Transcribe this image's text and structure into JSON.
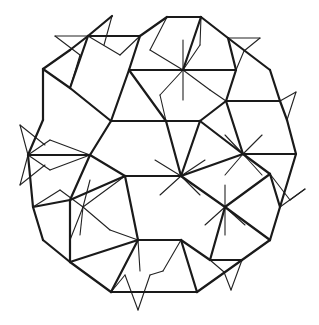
{
  "figure": {
    "background": "#ffffff",
    "stroke_color": "#1a1a1a",
    "thick_edges": [
      [
        112,
        16,
        88,
        36
      ],
      [
        88,
        36,
        140,
        36
      ],
      [
        140,
        36,
        167,
        17
      ],
      [
        167,
        17,
        201,
        17
      ],
      [
        201,
        17,
        228,
        38
      ],
      [
        228,
        38,
        270,
        70
      ],
      [
        270,
        70,
        280,
        101
      ],
      [
        280,
        101,
        287,
        120
      ],
      [
        287,
        120,
        296,
        154
      ],
      [
        296,
        154,
        280,
        207
      ],
      [
        280,
        207,
        270,
        240
      ],
      [
        270,
        240,
        242,
        260
      ],
      [
        242,
        260,
        197,
        292
      ],
      [
        197,
        292,
        111,
        292
      ],
      [
        111,
        292,
        70,
        262
      ],
      [
        70,
        262,
        43,
        240
      ],
      [
        43,
        240,
        33,
        207
      ],
      [
        33,
        207,
        28,
        155
      ],
      [
        28,
        155,
        43,
        120
      ],
      [
        43,
        120,
        43,
        69
      ],
      [
        43,
        69,
        70,
        50
      ],
      [
        70,
        50,
        88,
        36
      ],
      [
        43,
        69,
        70,
        88
      ],
      [
        70,
        88,
        88,
        36
      ],
      [
        70,
        88,
        111,
        121
      ],
      [
        111,
        121,
        129,
        70
      ],
      [
        129,
        70,
        140,
        36
      ],
      [
        129,
        70,
        183,
        70
      ],
      [
        183,
        70,
        201,
        17
      ],
      [
        183,
        70,
        236,
        70
      ],
      [
        236,
        70,
        228,
        38
      ],
      [
        236,
        70,
        226,
        101
      ],
      [
        226,
        101,
        280,
        101
      ],
      [
        226,
        101,
        200,
        121
      ],
      [
        200,
        121,
        166,
        121
      ],
      [
        166,
        121,
        129,
        70
      ],
      [
        166,
        121,
        111,
        121
      ],
      [
        111,
        121,
        90,
        155
      ],
      [
        90,
        155,
        28,
        155
      ],
      [
        90,
        155,
        125,
        176
      ],
      [
        125,
        176,
        70,
        200
      ],
      [
        70,
        200,
        33,
        207
      ],
      [
        125,
        176,
        181,
        176
      ],
      [
        181,
        176,
        200,
        121
      ],
      [
        181,
        176,
        243,
        154
      ],
      [
        243,
        154,
        226,
        101
      ],
      [
        243,
        154,
        296,
        154
      ],
      [
        243,
        154,
        270,
        174
      ],
      [
        270,
        174,
        280,
        207
      ],
      [
        270,
        174,
        225,
        207
      ],
      [
        225,
        207,
        181,
        176
      ],
      [
        225,
        207,
        270,
        240
      ],
      [
        225,
        207,
        210,
        260
      ],
      [
        210,
        260,
        242,
        260
      ],
      [
        210,
        260,
        181,
        240
      ],
      [
        181,
        240,
        138,
        240
      ],
      [
        181,
        240,
        197,
        292
      ],
      [
        138,
        240,
        125,
        176
      ],
      [
        138,
        240,
        111,
        292
      ],
      [
        138,
        240,
        70,
        262
      ],
      [
        70,
        262,
        70,
        200
      ],
      [
        90,
        155,
        70,
        200
      ],
      [
        166,
        121,
        181,
        176
      ],
      [
        200,
        121,
        243,
        154
      ]
    ],
    "thin_edges": [
      [
        88,
        36,
        120,
        55
      ],
      [
        120,
        55,
        140,
        36
      ],
      [
        112,
        16,
        104,
        45
      ],
      [
        55,
        36,
        88,
        36
      ],
      [
        55,
        36,
        80,
        55
      ],
      [
        80,
        55,
        70,
        88
      ],
      [
        183,
        70,
        150,
        50
      ],
      [
        183,
        70,
        200,
        45
      ],
      [
        183,
        70,
        210,
        90
      ],
      [
        183,
        70,
        160,
        95
      ],
      [
        183,
        70,
        183,
        40
      ],
      [
        183,
        70,
        183,
        100
      ],
      [
        150,
        50,
        167,
        17
      ],
      [
        200,
        45,
        201,
        17
      ],
      [
        210,
        90,
        226,
        101
      ],
      [
        160,
        95,
        166,
        121
      ],
      [
        228,
        38,
        260,
        38
      ],
      [
        260,
        38,
        244,
        51
      ],
      [
        244,
        51,
        236,
        70
      ],
      [
        296,
        92,
        280,
        101
      ],
      [
        296,
        92,
        287,
        120
      ],
      [
        28,
        155,
        20,
        125
      ],
      [
        20,
        125,
        45,
        145
      ],
      [
        28,
        155,
        20,
        185
      ],
      [
        20,
        185,
        45,
        165
      ],
      [
        28,
        155,
        50,
        140
      ],
      [
        28,
        155,
        50,
        170
      ],
      [
        50,
        140,
        90,
        155
      ],
      [
        50,
        170,
        90,
        155
      ],
      [
        83,
        207,
        125,
        176
      ],
      [
        83,
        207,
        70,
        240
      ],
      [
        83,
        207,
        110,
        230
      ],
      [
        83,
        207,
        60,
        190
      ],
      [
        83,
        207,
        90,
        180
      ],
      [
        83,
        207,
        80,
        235
      ],
      [
        60,
        190,
        33,
        207
      ],
      [
        110,
        230,
        138,
        240
      ],
      [
        181,
        176,
        155,
        160
      ],
      [
        181,
        176,
        205,
        160
      ],
      [
        181,
        176,
        160,
        195
      ],
      [
        181,
        176,
        200,
        195
      ],
      [
        243,
        154,
        225,
        135
      ],
      [
        243,
        154,
        262,
        135
      ],
      [
        243,
        154,
        225,
        175
      ],
      [
        243,
        154,
        262,
        175
      ],
      [
        305,
        189,
        280,
        207
      ],
      [
        305,
        189,
        290,
        200
      ],
      [
        290,
        200,
        270,
        174
      ],
      [
        225,
        207,
        205,
        225
      ],
      [
        225,
        207,
        245,
        225
      ],
      [
        225,
        207,
        225,
        185
      ],
      [
        225,
        207,
        225,
        235
      ],
      [
        231,
        290,
        224,
        272
      ],
      [
        231,
        290,
        242,
        260
      ],
      [
        224,
        272,
        210,
        260
      ],
      [
        138,
        310,
        125,
        275
      ],
      [
        138,
        310,
        150,
        275
      ],
      [
        125,
        275,
        111,
        292
      ],
      [
        150,
        275,
        163,
        271
      ],
      [
        163,
        271,
        181,
        240
      ],
      [
        140,
        271,
        138,
        240
      ]
    ]
  }
}
